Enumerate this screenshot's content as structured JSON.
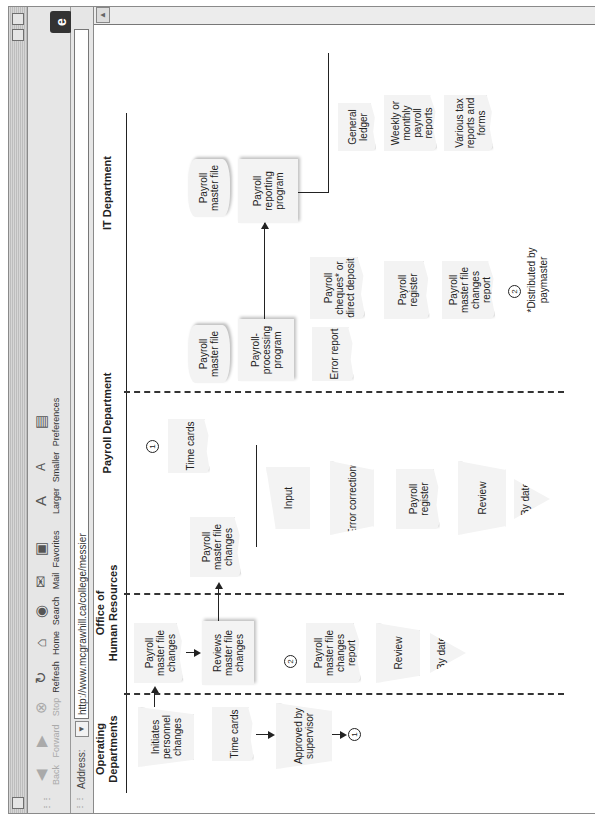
{
  "browser": {
    "toolbar": [
      {
        "label": "Back",
        "icon": "back-arrow-icon",
        "disabled": true
      },
      {
        "label": "Forward",
        "icon": "forward-arrow-icon",
        "disabled": true
      },
      {
        "label": "Stop",
        "icon": "stop-icon",
        "disabled": true
      },
      {
        "label": "Refresh",
        "icon": "refresh-icon",
        "disabled": false
      },
      {
        "label": "Home",
        "icon": "home-icon",
        "disabled": false
      },
      {
        "label": "Search",
        "icon": "search-icon",
        "disabled": false
      },
      {
        "label": "Mail",
        "icon": "mail-icon",
        "disabled": false
      },
      {
        "label": "Favorites",
        "icon": "favorites-icon",
        "disabled": false
      },
      {
        "label": "Larger",
        "icon": "text-larger-icon",
        "disabled": false
      },
      {
        "label": "Smaller",
        "icon": "text-smaller-icon",
        "disabled": false
      },
      {
        "label": "Preferences",
        "icon": "preferences-icon",
        "disabled": false
      }
    ],
    "address_label": "Address:",
    "address_value": "http://www.mcgrawhill.ca/college/messier",
    "logo": "e"
  },
  "diagram": {
    "columns": [
      {
        "label": "Operating\nDepartments"
      },
      {
        "label": "Office of\nHuman Resources"
      },
      {
        "label": "Payroll Department"
      },
      {
        "label": "IT Department"
      }
    ],
    "shapes": {
      "initiates": "Initiates personnel changes",
      "time_cards_op": "Time cards",
      "approved": "Approved by supervisor",
      "hr_pmfc": "Payroll master file changes",
      "hr_reviews": "Reviews master file changes",
      "hr_report": "Payroll master file changes report",
      "hr_review": "Review",
      "hr_bydate": "By date",
      "pd_pmfc": "Payroll master file changes",
      "pd_timecards": "Time cards",
      "pd_input": "Input",
      "pd_errcorr": "Error corrections",
      "pd_register": "Payroll register",
      "pd_review": "Review",
      "pd_bydate": "By date",
      "it_pmf1": "Payroll master file",
      "it_processing": "Payroll-processing program",
      "it_error": "Error report",
      "it_cheques": "Payroll cheques* or direct deposit",
      "it_register": "Payroll register",
      "it_pmfcr": "Payroll master file changes report",
      "it_pmf2": "Payroll master file",
      "it_reporting": "Payroll reporting program",
      "it_ledger": "General ledger",
      "it_weekly": "Weekly or monthly payroll reports",
      "it_tax": "Various tax reports and forms"
    },
    "connectors": {
      "one": "1",
      "two": "2"
    },
    "footnote": "*Distributed by paymaster"
  }
}
